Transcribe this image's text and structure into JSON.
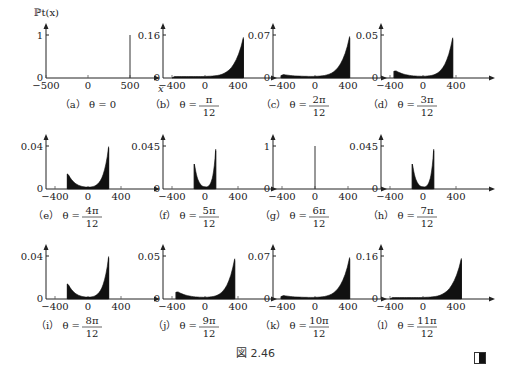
{
  "figure": {
    "title": "図 2.46",
    "ylabel": "ℙt(x)",
    "xlabel": "x"
  },
  "chart_data": [
    {
      "id": "a",
      "type": "line",
      "caption_prefix": "（a）",
      "theta": "θ = 0",
      "theta_num": "",
      "theta_den": "",
      "ylim": [
        0,
        1
      ],
      "ytop_label": "1",
      "xticks": [
        -500,
        0,
        500
      ],
      "xlim": [
        -500,
        500
      ],
      "shape": "spike",
      "peaks": [
        {
          "x": 500,
          "y": 1
        }
      ]
    },
    {
      "id": "b",
      "type": "area",
      "caption_prefix": "（b）",
      "theta": "θ =",
      "theta_num": "π",
      "theta_den": "12",
      "ylim": [
        0,
        0.16
      ],
      "ytop_label": "0.16",
      "xticks": [
        -400,
        0,
        400
      ],
      "xlim": [
        -400,
        500
      ],
      "shape": "right-edge",
      "left_edge": -400,
      "right_edge": 465,
      "peak_right": 0.145,
      "peak_left": 0.0
    },
    {
      "id": "c",
      "type": "area",
      "caption_prefix": "（c）",
      "theta": "θ =",
      "theta_num": "2π",
      "theta_den": "12",
      "ylim": [
        0,
        0.07
      ],
      "ytop_label": "0.07",
      "xticks": [
        -400,
        0,
        400
      ],
      "xlim": [
        -450,
        500
      ],
      "shape": "two-edge",
      "left_edge": -410,
      "right_edge": 420,
      "peak_right": 0.065,
      "peak_left": 0.004
    },
    {
      "id": "d",
      "type": "area",
      "caption_prefix": "（d）",
      "theta": "θ =",
      "theta_num": "3π",
      "theta_den": "12",
      "ylim": [
        0,
        0.05
      ],
      "ytop_label": "0.05",
      "xticks": [
        -400,
        0,
        400
      ],
      "xlim": [
        -450,
        500
      ],
      "shape": "two-edge",
      "left_edge": -350,
      "right_edge": 360,
      "peak_right": 0.045,
      "peak_left": 0.008
    },
    {
      "id": "e",
      "type": "area",
      "caption_prefix": "（e）",
      "theta": "θ =",
      "theta_num": "4π",
      "theta_den": "12",
      "ylim": [
        0,
        0.04
      ],
      "ytop_label": "0.04",
      "xticks": [
        -400,
        0,
        400
      ],
      "xlim": [
        -450,
        500
      ],
      "shape": "two-edge",
      "left_edge": -250,
      "right_edge": 250,
      "peak_right": 0.038,
      "peak_left": 0.014
    },
    {
      "id": "f",
      "type": "area",
      "caption_prefix": "（f）",
      "theta": "θ =",
      "theta_num": "5π",
      "theta_den": "12",
      "ylim": [
        0,
        0.045
      ],
      "ytop_label": "0.045",
      "xticks": [
        -400,
        0,
        400
      ],
      "xlim": [
        -450,
        500
      ],
      "shape": "two-edge",
      "left_edge": -130,
      "right_edge": 130,
      "peak_right": 0.04,
      "peak_left": 0.026
    },
    {
      "id": "g",
      "type": "line",
      "caption_prefix": "（g）",
      "theta": "θ =",
      "theta_num": "6π",
      "theta_den": "12",
      "ylim": [
        0,
        1
      ],
      "ytop_label": "1",
      "xticks": [
        -400,
        0,
        400
      ],
      "xlim": [
        -450,
        500
      ],
      "shape": "spike",
      "peaks": [
        {
          "x": 0,
          "y": 1
        }
      ]
    },
    {
      "id": "h",
      "type": "area",
      "caption_prefix": "（h）",
      "theta": "θ =",
      "theta_num": "7π",
      "theta_den": "12",
      "ylim": [
        0,
        0.045
      ],
      "ytop_label": "0.045",
      "xticks": [
        -400,
        0,
        400
      ],
      "xlim": [
        -450,
        500
      ],
      "shape": "two-edge",
      "left_edge": -130,
      "right_edge": 130,
      "peak_right": 0.04,
      "peak_left": 0.026
    },
    {
      "id": "i",
      "type": "area",
      "caption_prefix": "（i）",
      "theta": "θ =",
      "theta_num": "8π",
      "theta_den": "12",
      "ylim": [
        0,
        0.04
      ],
      "ytop_label": "0.04",
      "xticks": [
        -400,
        0,
        400
      ],
      "xlim": [
        -450,
        500
      ],
      "shape": "two-edge",
      "left_edge": -250,
      "right_edge": 250,
      "peak_right": 0.038,
      "peak_left": 0.014
    },
    {
      "id": "j",
      "type": "area",
      "caption_prefix": "（j）",
      "theta": "θ =",
      "theta_num": "9π",
      "theta_den": "12",
      "ylim": [
        0,
        0.05
      ],
      "ytop_label": "0.05",
      "xticks": [
        -400,
        0,
        400
      ],
      "xlim": [
        -450,
        500
      ],
      "shape": "two-edge",
      "left_edge": -350,
      "right_edge": 360,
      "peak_right": 0.045,
      "peak_left": 0.008
    },
    {
      "id": "k",
      "type": "area",
      "caption_prefix": "（k）",
      "theta": "θ =",
      "theta_num": "10π",
      "theta_den": "12",
      "ylim": [
        0,
        0.07
      ],
      "ytop_label": "0.07",
      "xticks": [
        -400,
        0,
        400
      ],
      "xlim": [
        -450,
        500
      ],
      "shape": "two-edge",
      "left_edge": -410,
      "right_edge": 420,
      "peak_right": 0.065,
      "peak_left": 0.004
    },
    {
      "id": "l",
      "type": "area",
      "caption_prefix": "（l）",
      "theta": "θ =",
      "theta_num": "11π",
      "theta_den": "12",
      "ylim": [
        0,
        0.16
      ],
      "ytop_label": "0.16",
      "xticks": [
        -400,
        0,
        400
      ],
      "xlim": [
        -450,
        500
      ],
      "shape": "right-edge",
      "left_edge": -400,
      "right_edge": 465,
      "peak_right": 0.145,
      "peak_left": 0.0
    }
  ],
  "layout": {
    "rows_baseline_y": [
      78,
      189,
      299
    ],
    "rows_top_y": [
      35,
      146,
      256
    ],
    "cols_axis_x": [
      46,
      163,
      273,
      381
    ],
    "panel_width": 114
  }
}
